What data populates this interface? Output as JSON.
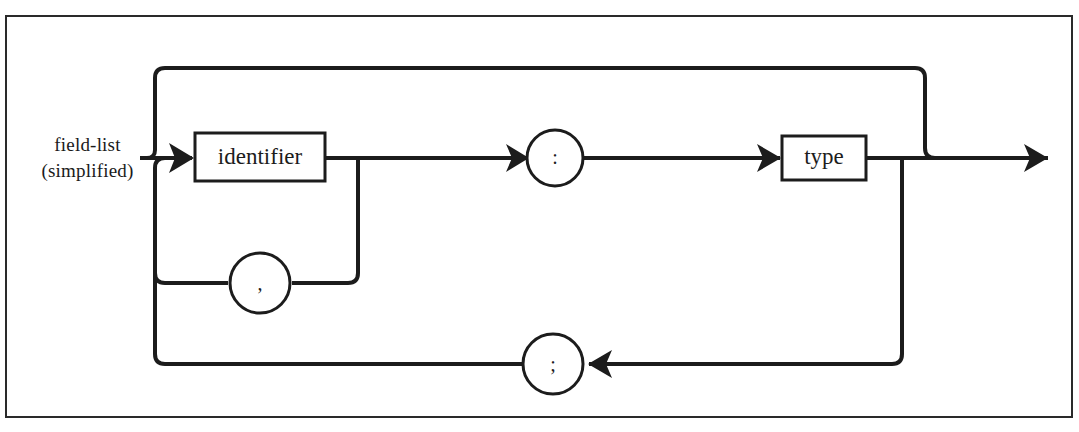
{
  "diagram": {
    "kind": "railroad-syntax-diagram",
    "title_lines": [
      "field-list",
      "(simplified)"
    ],
    "line_color": "#1c1c1c",
    "frame_color": "#2a2a2a",
    "background": "#ffffff",
    "nodes": {
      "identifier_box": {
        "label": "identifier",
        "shape": "rectangle",
        "x": 195,
        "y": 133,
        "width": 130,
        "height": 48
      },
      "type_box": {
        "label": "type",
        "shape": "rectangle",
        "x": 782,
        "y": 136,
        "width": 84,
        "height": 44
      },
      "colon_circle": {
        "label": ":",
        "shape": "circle",
        "cx": 555,
        "cy": 158,
        "r": 28
      },
      "comma_circle": {
        "label": ",",
        "shape": "circle",
        "cx": 260,
        "cy": 283,
        "r": 30
      },
      "semicolon_circle": {
        "label": ";",
        "shape": "circle",
        "cx": 553,
        "cy": 364,
        "r": 30
      }
    },
    "arrows": [
      {
        "name": "into-identifier",
        "x": 190,
        "y": 158,
        "direction": "right"
      },
      {
        "name": "into-colon",
        "x": 527,
        "y": 158,
        "direction": "right"
      },
      {
        "name": "into-type",
        "x": 778,
        "y": 158,
        "direction": "right"
      },
      {
        "name": "exit",
        "x": 1047,
        "y": 158,
        "direction": "right"
      },
      {
        "name": "semicolon-loop",
        "x": 588,
        "y": 364,
        "direction": "left"
      }
    ],
    "paths": {
      "entry": "entry stub into identifier",
      "top_bypass": "skip loop from entry over identifier/colon/type to exit",
      "comma_loop": "repeat identifier separated by comma",
      "semicolon_loop": "repeat field declarations separated by semicolon"
    }
  }
}
